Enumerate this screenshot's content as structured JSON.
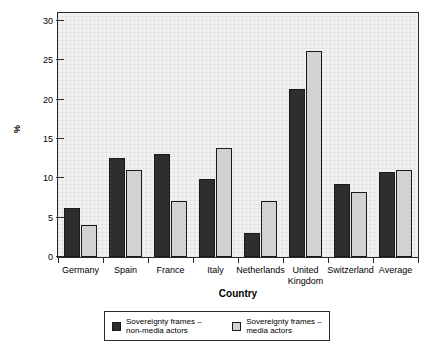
{
  "chart_data": {
    "type": "bar",
    "title": "",
    "xlabel": "Country",
    "ylabel": "%",
    "ylim": [
      0,
      31
    ],
    "yticks": [
      0,
      5,
      10,
      15,
      20,
      25,
      30
    ],
    "ytick_labels": [
      "0",
      "5",
      "10",
      "15",
      "20",
      "25",
      "30"
    ],
    "grid": true,
    "legend_position": "bottom",
    "categories": [
      "Germany",
      "Spain",
      "France",
      "Italy",
      "Netherlands",
      "United\nKingdom",
      "Switzerland",
      "Average"
    ],
    "series": [
      {
        "name": "Sovereignty frames –\nnon-media actors",
        "color": "#2e2e2e",
        "values": [
          6.2,
          12.6,
          13.1,
          9.9,
          3.0,
          21.3,
          9.3,
          10.8
        ]
      },
      {
        "name": "Sovereignty frames –\nmedia actors",
        "color": "#d2d2d2",
        "values": [
          4.1,
          11.0,
          7.1,
          13.8,
          7.1,
          26.2,
          8.3,
          11.0
        ]
      }
    ]
  },
  "legend": {
    "entries": [
      {
        "label": "Sovereignty frames –\nnon-media actors",
        "swatch": "dark"
      },
      {
        "label": "Sovereignty frames –\nmedia actors",
        "swatch": "light"
      }
    ]
  },
  "colors": {
    "series_non_media": "#2e2e2e",
    "series_media": "#d2d2d2",
    "axis": "#2b2b2b",
    "plot_background": "#f2f2f2",
    "page_background": "#ffffff"
  }
}
